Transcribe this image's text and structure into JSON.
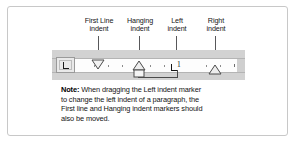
{
  "figure": {
    "border_color": "#c8c8c8",
    "background": "#ffffff"
  },
  "callouts": [
    {
      "id": "first-line-indent",
      "line1": "First Line",
      "line2": "indent"
    },
    {
      "id": "hanging-indent",
      "line1": "Hanging",
      "line2": "indent"
    },
    {
      "id": "left-indent",
      "line1": "Left",
      "line2": "indent"
    },
    {
      "id": "right-indent",
      "line1": "Right",
      "line2": "indent"
    }
  ],
  "ruler": {
    "tab_selector_glyph": "L",
    "tab_selector_name": "left-tab-stop",
    "number_labels": [
      "1"
    ],
    "markers": [
      {
        "id": "first-line-indent-marker",
        "shape": "down-triangle"
      },
      {
        "id": "hanging-indent-marker",
        "shape": "up-triangle-with-box"
      },
      {
        "id": "left-indent-marker",
        "shape": "tab-stop-L"
      },
      {
        "id": "right-indent-marker",
        "shape": "up-triangle"
      }
    ],
    "band_color": "#d2d2d2",
    "face_color": "#fdfdfd"
  },
  "note": {
    "label": "Note:",
    "line1": "When dragging the Left indent marker",
    "line2": "to change the left indent of a paragraph, the",
    "line3": "First line and Hanging indent markers should",
    "line4": "also be moved."
  }
}
